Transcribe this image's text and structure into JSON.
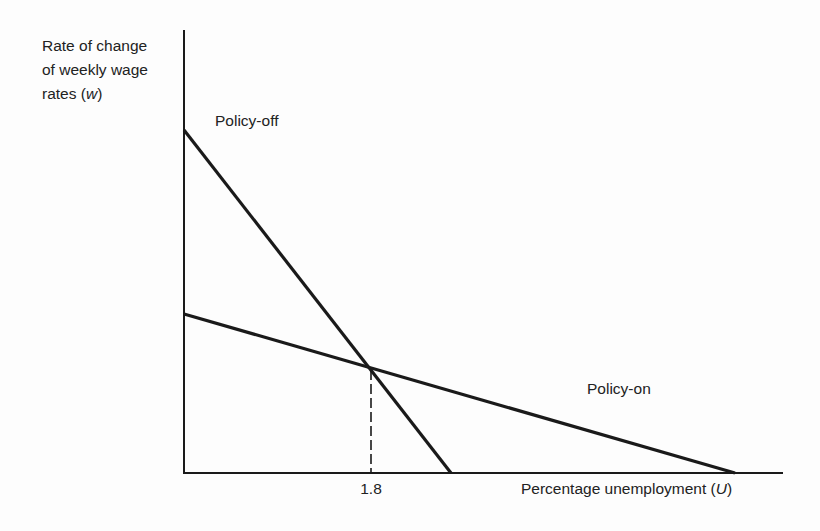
{
  "chart_data": {
    "type": "line",
    "title": "",
    "ylabel": "Rate of change of weekly wage rates (w)",
    "ylabel_lines": [
      "Rate of change",
      "of weekly wage",
      "rates ("
    ],
    "ylabel_var": "w",
    "xlabel": "Percentage unemployment (U)",
    "xlabel_text": "Percentage unemployment (",
    "xlabel_var": "U",
    "x_ticks": [
      {
        "value": 1.8,
        "label": "1.8"
      }
    ],
    "y_ticks": [],
    "grid": false,
    "legend": "none (curves labelled inline)",
    "series": [
      {
        "name": "Policy-off",
        "label": "Policy-off",
        "description": "Steeper downward-sloping line",
        "points_px": [
          [
            184,
            130
          ],
          [
            451,
            473
          ]
        ],
        "approx_points": [
          {
            "U": 0,
            "w": "high intercept"
          },
          {
            "U": 2.6,
            "w": 0
          }
        ]
      },
      {
        "name": "Policy-on",
        "label": "Policy-on",
        "description": "Flatter downward-sloping line",
        "points_px": [
          [
            184,
            314
          ],
          [
            735,
            473
          ]
        ],
        "approx_points": [
          {
            "U": 0,
            "w": "lower intercept"
          },
          {
            "U": 5.3,
            "w": 0
          }
        ]
      }
    ],
    "annotations": [
      {
        "type": "intersection",
        "U": 1.8,
        "point_px": [
          371,
          370
        ],
        "dashed_drop_line_to_x_axis": true
      }
    ],
    "axis_px": {
      "origin": [
        184,
        473
      ],
      "y_top": 30,
      "x_right": 783
    }
  },
  "colors": {
    "line": "#1a1a1a",
    "text": "#222222",
    "background": "#fdfdfd"
  }
}
